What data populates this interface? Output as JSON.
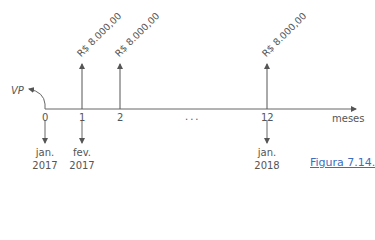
{
  "diagram": {
    "type": "cash-flow-timeline",
    "present_value_label": "VP",
    "axis_label": "meses",
    "ellipsis": "...",
    "ticks": [
      {
        "label": "0"
      },
      {
        "label": "1"
      },
      {
        "label": "2"
      },
      {
        "label": "12"
      }
    ],
    "payments": [
      {
        "period": "1",
        "value": "R$ 8.000,00"
      },
      {
        "period": "2",
        "value": "R$ 8.000,00"
      },
      {
        "period": "12",
        "value": "R$ 8.000,00"
      }
    ],
    "dates": [
      {
        "period": "0",
        "month": "jan.",
        "year": "2017"
      },
      {
        "period": "1",
        "month": "fev.",
        "year": "2017"
      },
      {
        "period": "12",
        "month": "jan.",
        "year": "2018"
      }
    ],
    "caption": "Figura 7.14."
  },
  "colors": {
    "line": "#666666",
    "text": "#555555",
    "caption": "#3a6fc0"
  }
}
